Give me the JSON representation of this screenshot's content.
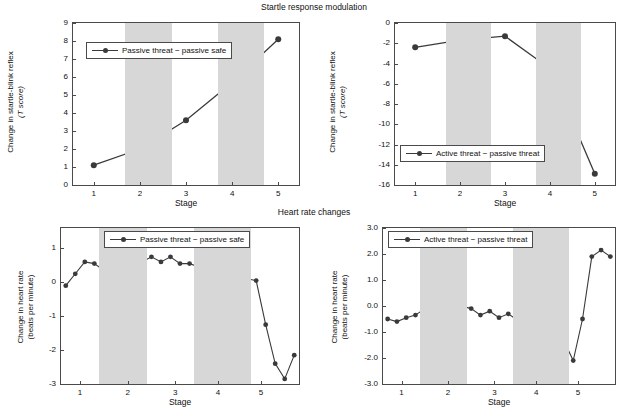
{
  "titles": {
    "top": "Startle response modulation",
    "bottom": "Heart rate changes"
  },
  "caption": "",
  "common": {
    "xlabel": "Stage",
    "line_color": "#3a3a3a",
    "band_color": "#d7d7d7",
    "axis_color": "#4a4a4a"
  },
  "chart_data": [
    {
      "id": "startle-passive",
      "type": "line",
      "title": "Startle response modulation",
      "legend": "Passive threat  −  passive safe",
      "legend_position": "top-left-inside",
      "xlabel": "Stage",
      "ylabel": "Change in startle-blink reflex\n(T score)",
      "ylabel_line1": "Change in startle-blink reflex",
      "ylabel_line2": "(T score)",
      "x": [
        1,
        2,
        3,
        4,
        5
      ],
      "values": [
        1.1,
        2.0,
        3.6,
        5.7,
        8.1
      ],
      "xticklabels": [
        "1",
        "2",
        "3",
        "4",
        "5"
      ],
      "yticklabels": [
        "0",
        "1",
        "2",
        "3",
        "4",
        "5",
        "6",
        "7",
        "8",
        "9"
      ],
      "ylim": [
        0,
        9
      ],
      "xlim": [
        0.55,
        5.45
      ],
      "grid": false,
      "bands": [
        [
          1.5,
          2.5
        ],
        [
          3.5,
          4.5
        ]
      ]
    },
    {
      "id": "startle-active",
      "type": "line",
      "title": "Startle response modulation",
      "legend": "Active threat  −  passive threat",
      "legend_position": "bottom-left-inside",
      "xlabel": "Stage",
      "ylabel": "Change in startle-blink reflex\n(T score)",
      "ylabel_line1": "Change in startle-blink reflex",
      "ylabel_line2": "(T score)",
      "x": [
        1,
        2,
        3,
        4,
        5
      ],
      "values": [
        -2.4,
        -1.7,
        -1.3,
        -4.5,
        -14.9
      ],
      "xticklabels": [
        "1",
        "2",
        "3",
        "4",
        "5"
      ],
      "yticklabels": [
        "0",
        "-2",
        "-4",
        "-6",
        "-8",
        "-10",
        "-12",
        "-14",
        "-16"
      ],
      "ylim": [
        -16,
        0
      ],
      "xlim": [
        0.55,
        5.45
      ],
      "grid": false,
      "bands": [
        [
          1.5,
          2.5
        ],
        [
          3.5,
          4.5
        ]
      ]
    },
    {
      "id": "heartrate-passive",
      "type": "line",
      "title": "Heart rate changes",
      "legend": "Passive threat  −  passive safe",
      "legend_position": "top-center-inside",
      "xlabel": "Stage",
      "ylabel": "Change in heart rate\n(beats per minute)",
      "ylabel_line1": "Change in heart rate",
      "ylabel_line2": "(beats per minute)",
      "x": [
        1,
        2,
        3,
        4,
        5,
        6,
        7,
        8,
        9,
        10,
        11,
        12,
        13,
        14,
        15,
        16,
        17,
        18,
        19,
        20,
        21,
        22,
        23,
        24,
        25
      ],
      "values": [
        -0.1,
        0.25,
        0.6,
        0.55,
        0.35,
        0.45,
        0.5,
        0.4,
        0.6,
        0.75,
        0.6,
        0.75,
        0.55,
        0.55,
        0.45,
        0.6,
        0.5,
        0.55,
        0.6,
        0.1,
        0.05,
        -1.25,
        -2.4,
        -2.85,
        -2.15
      ],
      "xticklabels": [
        "1",
        "2",
        "3",
        "4",
        "5"
      ],
      "yticklabels": [
        "1",
        "0",
        "-1",
        "-2",
        "-3"
      ],
      "ylim": [
        -3,
        1.6
      ],
      "xlim": [
        0.5,
        25.5
      ],
      "grid": false,
      "bands": [
        [
          4.5,
          9.5
        ],
        [
          14.5,
          20.5
        ]
      ]
    },
    {
      "id": "heartrate-active",
      "type": "line",
      "title": "Heart rate changes",
      "legend": "Active threat  −  passive threat",
      "legend_position": "top-left-inside",
      "xlabel": "Stage",
      "ylabel": "Change in heart rate\n(beats per minute)",
      "ylabel_line1": "Change in heart rate",
      "ylabel_line2": "(beats per minute)",
      "x": [
        1,
        2,
        3,
        4,
        5,
        6,
        7,
        8,
        9,
        10,
        11,
        12,
        13,
        14,
        15,
        16,
        17,
        18,
        19,
        20,
        21,
        22,
        23,
        24,
        25
      ],
      "values": [
        -0.5,
        -0.6,
        -0.45,
        -0.35,
        -0.1,
        0.15,
        0.2,
        0.15,
        0.0,
        -0.1,
        -0.35,
        -0.2,
        -0.45,
        -0.3,
        -0.55,
        -0.4,
        -0.45,
        -0.55,
        -0.75,
        -1.35,
        -2.1,
        -0.5,
        1.9,
        2.15,
        1.9
      ],
      "xticklabels": [
        "1",
        "2",
        "3",
        "4",
        "5"
      ],
      "yticklabels": [
        "3.0",
        "2.0",
        "1.0",
        "0.0",
        "-1.0",
        "-2.0",
        "-3.0"
      ],
      "ylim": [
        -3.0,
        3.0
      ],
      "xlim": [
        0.5,
        25.5
      ],
      "grid": false,
      "bands": [
        [
          4.5,
          9.5
        ],
        [
          14.5,
          20.5
        ]
      ]
    }
  ]
}
